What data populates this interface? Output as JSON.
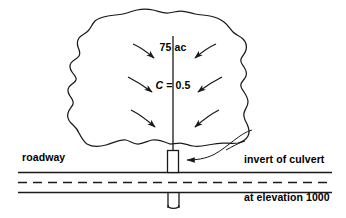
{
  "figure": {
    "stroke_color": "#1a1a1a",
    "text_color": "#000000",
    "background": "#ffffff"
  },
  "labels": {
    "area": "75 ac",
    "runoff_coefficient_symbol": "C",
    "runoff_coefficient_equals": " = 0.5",
    "roadway": "roadway",
    "culvert_note_line1": "invert of culvert",
    "culvert_note_line2": "at elevation 1000",
    "culvert_note_line3": "slope  =  1%"
  },
  "elements": {
    "watershed_boundary": "watershed-outline",
    "stream_line": "main-channel",
    "flow_arrows_count": 6,
    "culvert_barrel": "culvert-through-embankment",
    "culvert_outlet": "culvert-outlet-pipe",
    "road_edge_upper": "roadway-upper-edge",
    "road_centerline": "roadway-dashed-centerline",
    "road_edge_lower": "roadway-lower-edge",
    "leader_line": "culvert-callout-leader"
  }
}
